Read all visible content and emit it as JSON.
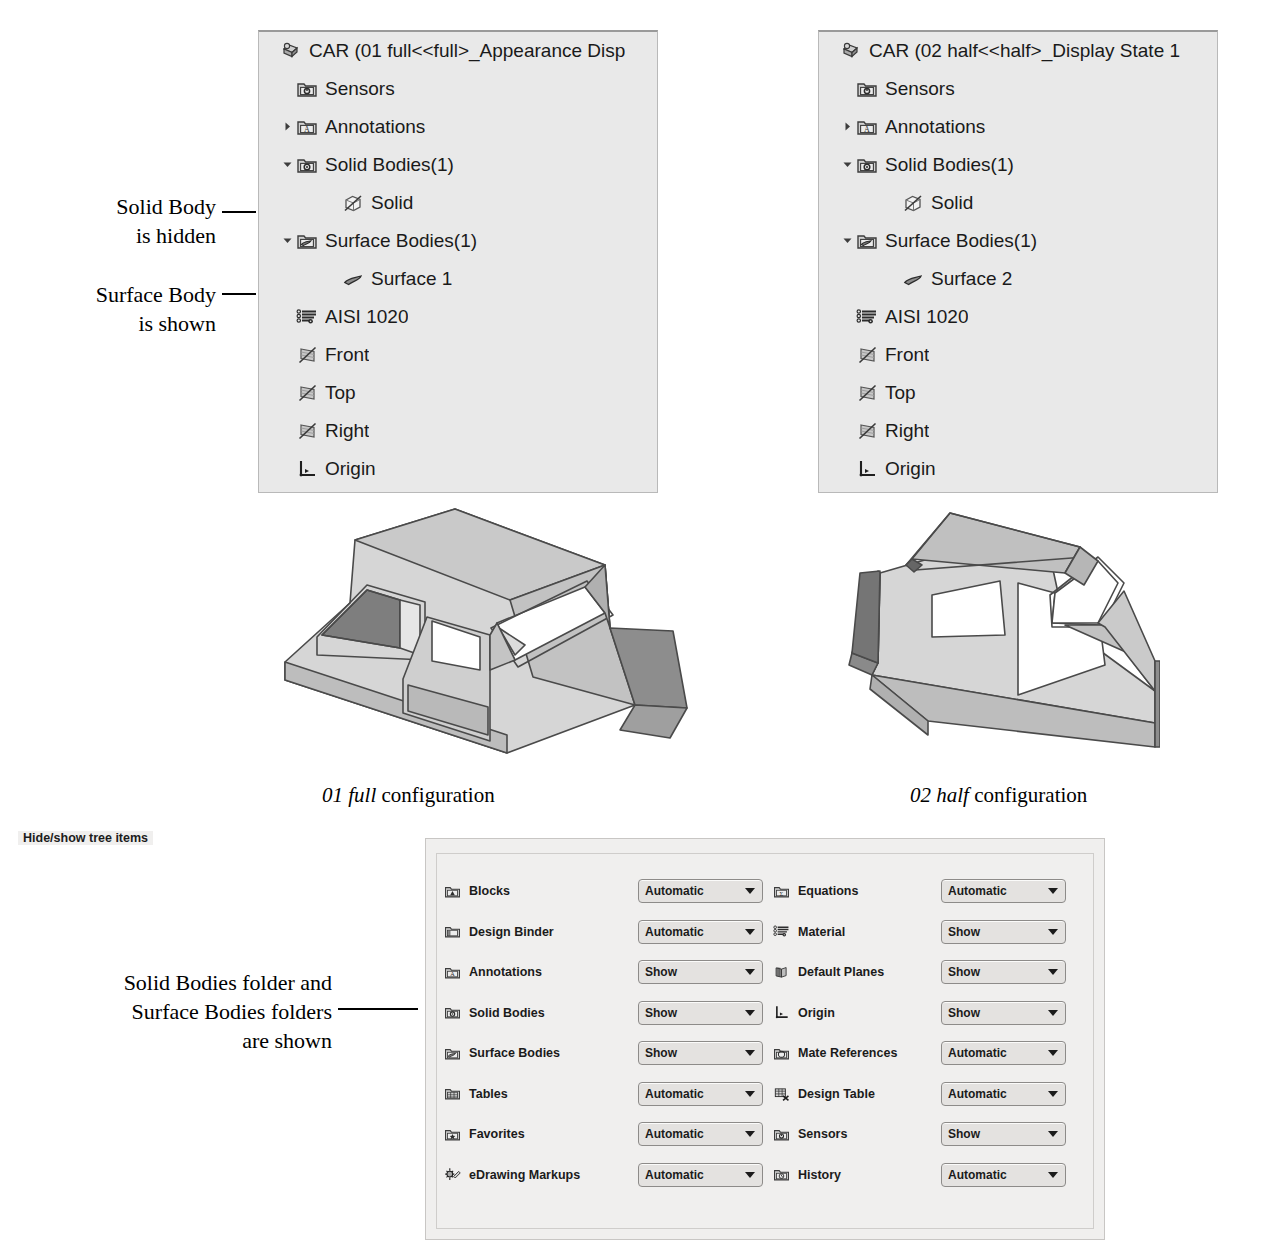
{
  "trees": [
    {
      "id": "left",
      "title": "CAR  (01 full<<full>_Appearance Disp",
      "items": [
        {
          "label": "Sensors",
          "icon": "sensors-folder-icon",
          "indent": 2,
          "arrow": ""
        },
        {
          "label": "Annotations",
          "icon": "annotations-folder-icon",
          "indent": 2,
          "arrow": "collapsed"
        },
        {
          "label": "Solid Bodies(1)",
          "icon": "solid-bodies-folder-icon",
          "indent": 2,
          "arrow": "expanded"
        },
        {
          "label": "Solid",
          "icon": "hidden-solid-body-icon",
          "indent": 3,
          "arrow": ""
        },
        {
          "label": "Surface Bodies(1)",
          "icon": "surface-bodies-folder-icon",
          "indent": 2,
          "arrow": "expanded"
        },
        {
          "label": "Surface 1",
          "icon": "surface-body-icon",
          "indent": 3,
          "arrow": ""
        },
        {
          "label": "AISI 1020",
          "icon": "material-icon",
          "indent": 2,
          "arrow": ""
        },
        {
          "label": "Front",
          "icon": "hidden-plane-icon",
          "indent": 2,
          "arrow": ""
        },
        {
          "label": "Top",
          "icon": "hidden-plane-icon",
          "indent": 2,
          "arrow": ""
        },
        {
          "label": "Right",
          "icon": "hidden-plane-icon",
          "indent": 2,
          "arrow": ""
        },
        {
          "label": "Origin",
          "icon": "origin-icon",
          "indent": 2,
          "arrow": ""
        }
      ]
    },
    {
      "id": "right",
      "title": "CAR  (02 half<<half>_Display State 1",
      "items": [
        {
          "label": "Sensors",
          "icon": "sensors-folder-icon",
          "indent": 2,
          "arrow": ""
        },
        {
          "label": "Annotations",
          "icon": "annotations-folder-icon",
          "indent": 2,
          "arrow": "collapsed"
        },
        {
          "label": "Solid Bodies(1)",
          "icon": "solid-bodies-folder-icon",
          "indent": 2,
          "arrow": "expanded"
        },
        {
          "label": "Solid",
          "icon": "hidden-solid-body-icon",
          "indent": 3,
          "arrow": ""
        },
        {
          "label": "Surface Bodies(1)",
          "icon": "surface-bodies-folder-icon",
          "indent": 2,
          "arrow": "expanded"
        },
        {
          "label": "Surface 2",
          "icon": "surface-body-icon",
          "indent": 3,
          "arrow": ""
        },
        {
          "label": "AISI 1020",
          "icon": "material-icon",
          "indent": 2,
          "arrow": ""
        },
        {
          "label": "Front",
          "icon": "hidden-plane-icon",
          "indent": 2,
          "arrow": ""
        },
        {
          "label": "Top",
          "icon": "hidden-plane-icon",
          "indent": 2,
          "arrow": ""
        },
        {
          "label": "Right",
          "icon": "hidden-plane-icon",
          "indent": 2,
          "arrow": ""
        },
        {
          "label": "Origin",
          "icon": "origin-icon",
          "indent": 2,
          "arrow": ""
        }
      ]
    }
  ],
  "callouts": {
    "solid_body_hidden_line1": "Solid Body",
    "solid_body_hidden_line2": "is hidden",
    "surface_body_shown_line1": "Surface Body",
    "surface_body_shown_line2": "is shown",
    "folders_shown_line1": "Solid Bodies folder and",
    "folders_shown_line2": "Surface Bodies folders",
    "folders_shown_line3": "are shown"
  },
  "captions": {
    "left_italic": "01 full",
    "left_rest": " configuration",
    "right_italic": "02 half",
    "right_rest": " configuration"
  },
  "dialog": {
    "group_title": "Hide/show tree items",
    "rows": [
      {
        "left_label": "Blocks",
        "left_icon": "blocks-folder-icon",
        "left_value": "Automatic",
        "right_label": "Equations",
        "right_icon": "equations-folder-icon",
        "right_value": "Automatic"
      },
      {
        "left_label": "Design Binder",
        "left_icon": "design-binder-folder-icon",
        "left_value": "Automatic",
        "right_label": "Material",
        "right_icon": "material-icon",
        "right_value": "Show"
      },
      {
        "left_label": "Annotations",
        "left_icon": "annotations-folder-icon",
        "left_value": "Show",
        "right_label": "Default Planes",
        "right_icon": "default-planes-icon",
        "right_value": "Show"
      },
      {
        "left_label": "Solid Bodies",
        "left_icon": "solid-bodies-folder-icon",
        "left_value": "Show",
        "right_label": "Origin",
        "right_icon": "origin-icon",
        "right_value": "Show"
      },
      {
        "left_label": "Surface Bodies",
        "left_icon": "surface-bodies-folder-icon",
        "left_value": "Show",
        "right_label": "Mate References",
        "right_icon": "mate-references-folder-icon",
        "right_value": "Automatic"
      },
      {
        "left_label": "Tables",
        "left_icon": "tables-folder-icon",
        "left_value": "Automatic",
        "right_label": "Design Table",
        "right_icon": "design-table-icon",
        "right_value": "Automatic"
      },
      {
        "left_label": "Favorites",
        "left_icon": "favorites-folder-icon",
        "left_value": "Automatic",
        "right_label": "Sensors",
        "right_icon": "sensors-folder-icon",
        "right_value": "Show"
      },
      {
        "left_label": "eDrawing Markups",
        "left_icon": "edrawing-markups-icon",
        "left_value": "Automatic",
        "right_label": "History",
        "right_icon": "history-folder-icon",
        "right_value": "Automatic"
      }
    ]
  },
  "colors": {
    "panel_bg": "#e9e9e9",
    "dialog_bg": "#f0efee",
    "model_light": "#d2d2d2",
    "model_mid": "#b4b4b4",
    "model_dark": "#7d7d7d",
    "outline": "#4a4a4a"
  }
}
